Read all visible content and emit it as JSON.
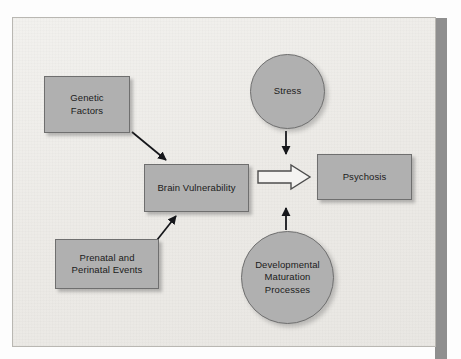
{
  "figure": {
    "type": "flowchart",
    "background_color": "#eeedea",
    "node_fill_color": "#b0b0b0",
    "node_border_color": "#6f6f6f",
    "text_color": "#1b1b1b"
  },
  "nodes": [
    {
      "id": "genetic",
      "label": "Genetic\nFactors",
      "shape": "rectangle"
    },
    {
      "id": "prenatal",
      "label": "Prenatal and\nPerinatal Events",
      "shape": "rectangle"
    },
    {
      "id": "brain",
      "label": "Brain Vulnerability",
      "shape": "rectangle"
    },
    {
      "id": "psychosis",
      "label": "Psychosis",
      "shape": "rectangle"
    },
    {
      "id": "stress",
      "label": "Stress",
      "shape": "circle"
    },
    {
      "id": "develop",
      "label": "Developmental\nMaturation\nProcesses",
      "shape": "circle"
    }
  ],
  "edges": [
    {
      "from": "genetic",
      "to": "brain",
      "style": "thin-arrow",
      "direction": "down-right"
    },
    {
      "from": "prenatal",
      "to": "brain",
      "style": "thin-arrow",
      "direction": "up-right"
    },
    {
      "from": "stress",
      "to": "flow",
      "style": "thin-arrow",
      "direction": "down"
    },
    {
      "from": "develop",
      "to": "flow",
      "style": "thin-arrow",
      "direction": "up"
    },
    {
      "from": "brain",
      "to": "psychosis",
      "style": "hollow-block-arrow",
      "direction": "right"
    }
  ]
}
